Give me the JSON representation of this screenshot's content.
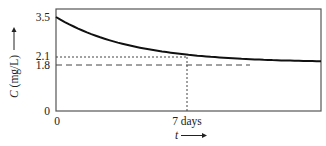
{
  "chart_data": {
    "type": "line",
    "title": "",
    "xlabel": "t",
    "ylabel": "C (mg/L)",
    "xlabel_arrow": "right",
    "ylabel_arrow": "up",
    "x_tick_labels": [
      {
        "value": 0,
        "label": "0"
      },
      {
        "value": 7,
        "label": "7 days"
      }
    ],
    "y_tick_labels": [
      {
        "value": 0,
        "label": "0"
      },
      {
        "value": 1.8,
        "label": "1.8"
      },
      {
        "value": 2.1,
        "label": "2.1"
      },
      {
        "value": 3.5,
        "label": "3.5"
      }
    ],
    "xlim": [
      0,
      14.2
    ],
    "ylim": [
      0,
      3.5
    ],
    "grid": false,
    "series": [
      {
        "name": "C(t)",
        "style": "solid",
        "x": [
          0,
          1,
          2,
          3,
          4,
          5,
          6,
          7,
          8,
          9,
          10,
          11,
          12,
          13,
          14.2
        ],
        "values": [
          3.5,
          3.13,
          2.85,
          2.62,
          2.44,
          2.3,
          2.19,
          2.1,
          2.03,
          1.98,
          1.94,
          1.91,
          1.89,
          1.87,
          1.85
        ]
      }
    ],
    "annotations": [
      {
        "type": "hline",
        "y": 2.1,
        "style": "dotted",
        "x_range": [
          0,
          7
        ]
      },
      {
        "type": "vline",
        "x": 7,
        "style": "dotted",
        "y_range": [
          0,
          2.1
        ]
      },
      {
        "type": "hline",
        "y": 1.8,
        "style": "dashed",
        "x_range": [
          0,
          10.2
        ],
        "note": "asymptote"
      }
    ]
  },
  "labels": {
    "y_axis_title": "C (mg/L)",
    "x_axis_title": "t",
    "y_tick_0": "0",
    "y_tick_18": "1.8",
    "y_tick_21": "2.1",
    "y_tick_35": "3.5",
    "x_tick_0": "0",
    "x_tick_7": "7 days"
  }
}
